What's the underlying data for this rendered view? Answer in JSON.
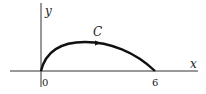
{
  "diagram": {
    "type": "curve-on-axes",
    "axes": {
      "x_label": "x",
      "y_label": "y"
    },
    "ticks": {
      "origin": "0",
      "end": "6"
    },
    "curve": {
      "label": "C",
      "from": [
        0,
        0
      ],
      "to": [
        6,
        0
      ],
      "direction": "left-to-right",
      "color": "#111111"
    }
  }
}
